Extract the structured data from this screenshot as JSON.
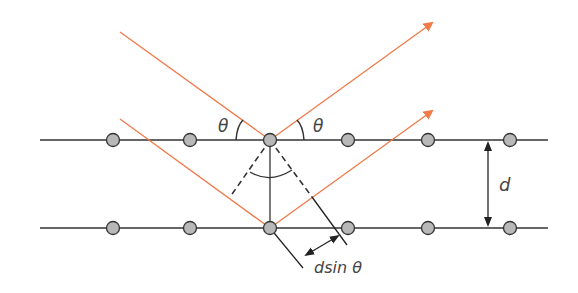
{
  "diagram": {
    "labels": {
      "theta_left": "θ",
      "theta_right": "θ",
      "spacing": "d",
      "path_difference": "dsin θ"
    },
    "colors": {
      "ray": "#f07a4a",
      "lattice_line": "#333333",
      "atom_fill": "#b8b8b8",
      "atom_stroke": "#333333"
    },
    "lattice_planes": [
      {
        "name": "upper-plane",
        "y": 140,
        "atoms_x": [
          113,
          190,
          270,
          348,
          428,
          510
        ]
      },
      {
        "name": "lower-plane",
        "y": 228,
        "atoms_x": [
          113,
          190,
          270,
          348,
          428,
          510
        ]
      }
    ]
  }
}
